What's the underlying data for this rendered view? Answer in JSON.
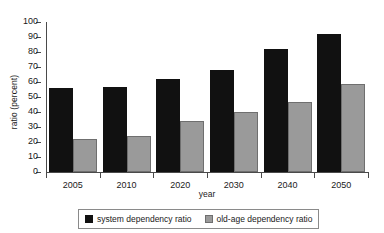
{
  "chart_data": {
    "type": "bar",
    "title": "",
    "xlabel": "year",
    "ylabel": "ratio (percent)",
    "categories": [
      "2005",
      "2010",
      "2020",
      "2030",
      "2040",
      "2050"
    ],
    "series": [
      {
        "name": "system dependency ratio",
        "color": "#111111",
        "values": [
          56,
          57,
          62,
          68,
          82,
          92
        ]
      },
      {
        "name": "old-age dependency ratio",
        "color": "#9a9a9a",
        "values": [
          22,
          24,
          34,
          40,
          47,
          59
        ]
      }
    ],
    "ylim": [
      0,
      100
    ],
    "yticks": [
      0,
      10,
      20,
      30,
      40,
      50,
      60,
      70,
      80,
      90,
      100
    ],
    "ytick_labels": [
      "0",
      "10",
      "20",
      "30",
      "40",
      "50",
      "60",
      "70",
      "80",
      "90",
      "100"
    ],
    "grid": false,
    "legend_position": "bottom"
  }
}
